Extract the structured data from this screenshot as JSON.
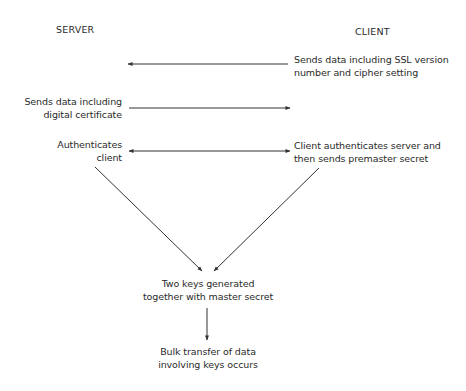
{
  "diagram": {
    "columns": {
      "server": "SERVER",
      "client": "CLIENT"
    },
    "steps": {
      "client_hello": {
        "line1": "Sends data including SSL version",
        "line2": "number and cipher setting"
      },
      "server_cert": {
        "line1": "Sends data including",
        "line2": "digital certificate"
      },
      "server_auth": {
        "line1": "Authenticates",
        "line2": "client"
      },
      "client_auth": {
        "line1": "Client authenticates server and",
        "line2": "then sends premaster secret"
      },
      "keys": {
        "line1": "Two keys generated",
        "line2": "together with master secret"
      },
      "bulk": {
        "line1": "Bulk transfer of data",
        "line2": "involving keys occurs"
      }
    },
    "edges": [
      {
        "from": "client_hello",
        "to": "server",
        "direction": "left"
      },
      {
        "from": "server_cert",
        "to": "client",
        "direction": "right"
      },
      {
        "from": "server_auth",
        "to": "client_auth",
        "direction": "both"
      },
      {
        "from": "server_auth",
        "to": "keys",
        "direction": "down"
      },
      {
        "from": "client_auth",
        "to": "keys",
        "direction": "down"
      },
      {
        "from": "keys",
        "to": "bulk",
        "direction": "down"
      }
    ],
    "line_color": "#333333"
  }
}
